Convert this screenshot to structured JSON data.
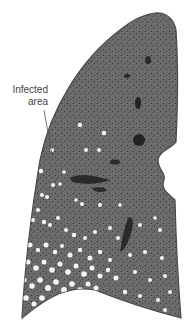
{
  "figure": {
    "annotation": {
      "line1": "Infected",
      "line2": "area"
    },
    "colors": {
      "tissue": "#6b6b6b",
      "tissue_dark": "#3a3a3a",
      "lesions": "#f4f4f4",
      "label": "#444444",
      "background": "#ffffff"
    }
  }
}
